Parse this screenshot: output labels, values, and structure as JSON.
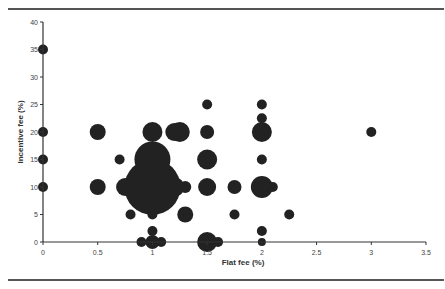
{
  "chart_data": {
    "type": "scatter",
    "subtype": "bubble",
    "title": "",
    "xlabel": "Flat fee (%)",
    "ylabel": "Incentive fee (%)",
    "xlim": [
      0,
      3.5
    ],
    "ylim": [
      0,
      40
    ],
    "xticks": [
      "0",
      "0.5",
      "1",
      "1.5",
      "2",
      "2.5",
      "3",
      "3.5"
    ],
    "yticks": [
      "0",
      "5",
      "10",
      "15",
      "20",
      "25",
      "30",
      "35",
      "40"
    ],
    "grid": false,
    "legend": null,
    "bubble_color": "#222222",
    "points": [
      {
        "x": 0,
        "y": 35,
        "r": 5
      },
      {
        "x": 0,
        "y": 20,
        "r": 5
      },
      {
        "x": 0,
        "y": 15,
        "r": 5
      },
      {
        "x": 0,
        "y": 10,
        "r": 5
      },
      {
        "x": 0.5,
        "y": 20,
        "r": 8
      },
      {
        "x": 0.5,
        "y": 10,
        "r": 8
      },
      {
        "x": 0.7,
        "y": 15,
        "r": 5
      },
      {
        "x": 0.75,
        "y": 10,
        "r": 9
      },
      {
        "x": 0.8,
        "y": 5,
        "r": 5
      },
      {
        "x": 1,
        "y": 20,
        "r": 10
      },
      {
        "x": 1.25,
        "y": 20,
        "r": 10
      },
      {
        "x": 1.2,
        "y": 20,
        "r": 9
      },
      {
        "x": 1,
        "y": 15,
        "r": 18
      },
      {
        "x": 1,
        "y": 10,
        "r": 28
      },
      {
        "x": 1.2,
        "y": 10,
        "r": 10
      },
      {
        "x": 1.3,
        "y": 10,
        "r": 6
      },
      {
        "x": 0.85,
        "y": 10,
        "r": 10
      },
      {
        "x": 1,
        "y": 5,
        "r": 5
      },
      {
        "x": 1.3,
        "y": 5,
        "r": 8
      },
      {
        "x": 1,
        "y": 2,
        "r": 5
      },
      {
        "x": 1,
        "y": 0,
        "r": 7
      },
      {
        "x": 0.9,
        "y": 0,
        "r": 5
      },
      {
        "x": 1.08,
        "y": 0,
        "r": 5
      },
      {
        "x": 1.5,
        "y": 25,
        "r": 5
      },
      {
        "x": 1.5,
        "y": 20,
        "r": 7
      },
      {
        "x": 1.5,
        "y": 15,
        "r": 10
      },
      {
        "x": 1.5,
        "y": 10,
        "r": 9
      },
      {
        "x": 1.5,
        "y": 0,
        "r": 10
      },
      {
        "x": 1.6,
        "y": 0,
        "r": 5
      },
      {
        "x": 1.75,
        "y": 10,
        "r": 7
      },
      {
        "x": 1.75,
        "y": 5,
        "r": 5
      },
      {
        "x": 2,
        "y": 25,
        "r": 5
      },
      {
        "x": 2,
        "y": 22.5,
        "r": 5
      },
      {
        "x": 2,
        "y": 20,
        "r": 10
      },
      {
        "x": 2,
        "y": 15,
        "r": 5
      },
      {
        "x": 2,
        "y": 10,
        "r": 11
      },
      {
        "x": 2.1,
        "y": 10,
        "r": 5
      },
      {
        "x": 2,
        "y": 2,
        "r": 5
      },
      {
        "x": 2,
        "y": 0,
        "r": 4
      },
      {
        "x": 2.25,
        "y": 5,
        "r": 5
      },
      {
        "x": 3,
        "y": 20,
        "r": 5
      }
    ]
  }
}
